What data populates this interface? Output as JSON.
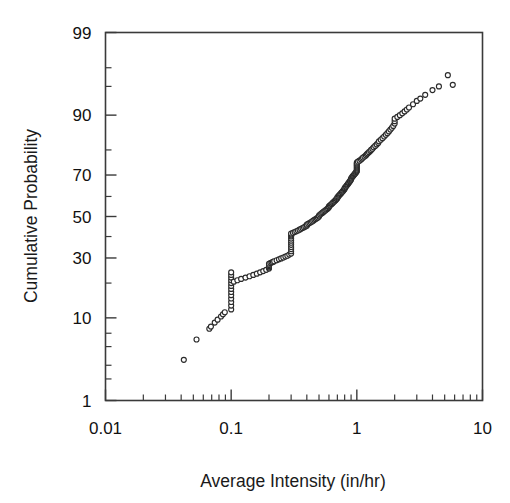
{
  "chart_data": {
    "type": "scatter",
    "title": "",
    "subtitle": "",
    "xlabel": "Average Intensity (in/hr)",
    "ylabel": "Cumulative Probability",
    "x_scale": "log10",
    "y_scale": "normal-probability",
    "xlim": [
      0.01,
      10
    ],
    "ylim": [
      1,
      99
    ],
    "grid": false,
    "legend": null,
    "x_tick_labels": [
      "0.01",
      "0.1",
      "1",
      "10"
    ],
    "x_tick_values": [
      0.01,
      0.1,
      1,
      10
    ],
    "y_tick_labels": [
      "1",
      "10",
      "30",
      "50",
      "70",
      "90",
      "99"
    ],
    "y_tick_values": [
      1,
      10,
      30,
      50,
      70,
      90,
      99
    ],
    "marker_style": "open-circle",
    "marker_color": "#2b2b2b",
    "marker_size_px": 5,
    "series": [
      {
        "name": "Average Intensity",
        "x": [
          0.042,
          0.053,
          0.067,
          0.069,
          0.074,
          0.078,
          0.083,
          0.086,
          0.089,
          0.1,
          0.1,
          0.1,
          0.1,
          0.1,
          0.1,
          0.1,
          0.1,
          0.1,
          0.1,
          0.1,
          0.1,
          0.1,
          0.105,
          0.112,
          0.12,
          0.13,
          0.14,
          0.15,
          0.16,
          0.17,
          0.18,
          0.19,
          0.2,
          0.2,
          0.2,
          0.2,
          0.2,
          0.205,
          0.21,
          0.215,
          0.22,
          0.23,
          0.24,
          0.25,
          0.26,
          0.27,
          0.28,
          0.29,
          0.3,
          0.3,
          0.3,
          0.3,
          0.3,
          0.3,
          0.3,
          0.3,
          0.3,
          0.3,
          0.3,
          0.3,
          0.31,
          0.32,
          0.33,
          0.34,
          0.35,
          0.36,
          0.37,
          0.38,
          0.39,
          0.4,
          0.4,
          0.41,
          0.42,
          0.43,
          0.44,
          0.45,
          0.46,
          0.47,
          0.48,
          0.49,
          0.5,
          0.5,
          0.51,
          0.52,
          0.53,
          0.54,
          0.55,
          0.56,
          0.57,
          0.58,
          0.59,
          0.6,
          0.6,
          0.61,
          0.62,
          0.63,
          0.64,
          0.65,
          0.66,
          0.67,
          0.68,
          0.69,
          0.7,
          0.7,
          0.71,
          0.72,
          0.73,
          0.74,
          0.75,
          0.76,
          0.77,
          0.78,
          0.79,
          0.8,
          0.8,
          0.81,
          0.82,
          0.83,
          0.84,
          0.85,
          0.86,
          0.87,
          0.88,
          0.89,
          0.9,
          0.9,
          0.91,
          0.92,
          0.93,
          0.94,
          0.95,
          0.96,
          0.97,
          0.98,
          0.99,
          1.0,
          1.0,
          1.0,
          1.0,
          1.0,
          1.0,
          1.0,
          1.0,
          1.0,
          1.0,
          1.02,
          1.05,
          1.08,
          1.1,
          1.12,
          1.15,
          1.18,
          1.2,
          1.22,
          1.25,
          1.28,
          1.3,
          1.33,
          1.36,
          1.4,
          1.44,
          1.48,
          1.5,
          1.55,
          1.6,
          1.65,
          1.7,
          1.75,
          1.8,
          1.85,
          1.9,
          1.95,
          2.0,
          2.0,
          2.0,
          2.1,
          2.2,
          2.3,
          2.4,
          2.5,
          2.6,
          2.8,
          3.0,
          3.2,
          3.5,
          4.0,
          4.5,
          5.3,
          5.8
        ],
        "y": [
          3.5,
          6.0,
          7.8,
          8.2,
          9.0,
          9.6,
          10.3,
          10.8,
          11.3,
          12.0,
          13.0,
          14.0,
          15.0,
          16.0,
          17.0,
          18.0,
          19.0,
          20.0,
          21.0,
          22.0,
          23.0,
          24.0,
          20.5,
          21.0,
          21.5,
          22.0,
          22.5,
          23.0,
          23.5,
          24.0,
          24.5,
          25.0,
          25.5,
          26.0,
          26.5,
          27.0,
          27.5,
          27.8,
          28.0,
          28.3,
          28.6,
          29.0,
          29.4,
          29.8,
          30.2,
          30.6,
          31.0,
          31.5,
          32.0,
          33.0,
          34.0,
          35.0,
          36.0,
          37.0,
          38.0,
          39.0,
          40.0,
          40.5,
          41.0,
          41.5,
          41.8,
          42.2,
          42.6,
          43.0,
          43.4,
          43.8,
          44.2,
          44.6,
          45.0,
          45.4,
          45.9,
          46.3,
          46.7,
          47.1,
          47.5,
          47.9,
          48.3,
          48.7,
          49.1,
          49.5,
          50.0,
          50.5,
          51.0,
          51.4,
          51.8,
          52.2,
          52.6,
          53.0,
          53.4,
          53.8,
          54.2,
          54.6,
          55.1,
          55.5,
          55.9,
          56.3,
          56.7,
          57.1,
          57.5,
          57.9,
          58.3,
          58.7,
          59.1,
          59.6,
          60.0,
          60.4,
          60.8,
          61.2,
          61.6,
          62.0,
          62.4,
          62.8,
          63.2,
          63.6,
          64.0,
          64.4,
          64.8,
          65.2,
          65.6,
          66.0,
          66.4,
          66.8,
          67.2,
          67.6,
          68.0,
          68.4,
          68.8,
          69.2,
          69.5,
          69.8,
          70.1,
          70.4,
          70.7,
          71.0,
          71.3,
          71.6,
          72.0,
          72.4,
          72.8,
          73.2,
          73.6,
          74.0,
          74.4,
          74.8,
          75.2,
          75.6,
          76.0,
          76.4,
          76.8,
          77.2,
          77.6,
          78.0,
          78.4,
          78.8,
          79.2,
          79.6,
          80.0,
          80.4,
          80.9,
          81.4,
          81.9,
          82.4,
          82.9,
          83.4,
          83.9,
          84.4,
          84.9,
          85.4,
          85.9,
          86.4,
          86.9,
          87.4,
          88.0,
          88.6,
          89.2,
          89.6,
          90.0,
          90.4,
          90.8,
          91.2,
          91.6,
          92.2,
          92.8,
          93.2,
          93.8,
          94.5,
          95.0,
          96.3,
          95.2
        ]
      }
    ]
  }
}
